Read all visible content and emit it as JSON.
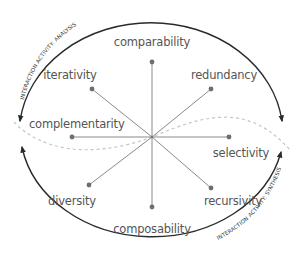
{
  "diagram": {
    "type": "radial-spoke diagram with cyclic arcs",
    "center": {
      "x": 152,
      "y": 137
    },
    "colors": {
      "spoke": "#8a8a8a",
      "dot": "#6e6e6e",
      "arc": "#2a2a2a",
      "dashed_curve": "#c4c4c4",
      "label": "#555555"
    },
    "spokes": [
      {
        "label": "comparability",
        "x": 152,
        "y": 62,
        "label_x": 152,
        "label_y": 46,
        "anchor": "middle"
      },
      {
        "label": "redundancy",
        "x": 211,
        "y": 89,
        "label_x": 224,
        "label_y": 79,
        "anchor": "middle"
      },
      {
        "label": "selectivity",
        "x": 229,
        "y": 137,
        "label_x": 241,
        "label_y": 157,
        "anchor": "middle"
      },
      {
        "label": "recursivity",
        "x": 211,
        "y": 188,
        "label_x": 233,
        "label_y": 205,
        "anchor": "middle"
      },
      {
        "label": "composability",
        "x": 152,
        "y": 207,
        "label_x": 152,
        "label_y": 233,
        "anchor": "middle"
      },
      {
        "label": "diversity",
        "x": 89,
        "y": 185,
        "label_x": 72,
        "label_y": 205,
        "anchor": "middle"
      },
      {
        "label": "complementarity",
        "x": 72,
        "y": 137,
        "label_x": 29,
        "label_y": 128,
        "anchor": "start"
      },
      {
        "label": "iteratively_placeholder_removed",
        "x": 92,
        "y": 89,
        "label_x": 70,
        "label_y": 79,
        "anchor": "middle"
      }
    ],
    "arcs": {
      "top": {
        "label": "INTERACTION ACTIVITY: ANALYSIS"
      },
      "bottom": {
        "label": "INTERACTION ACTIVITY: SYNTHESIS"
      }
    }
  },
  "labels": {
    "comparability": "comparability",
    "redundancy": "redundancy",
    "selectivity": "selectivity",
    "recursivity": "recursivity",
    "composability": "composability",
    "diversity": "diversity",
    "complementarity": "complementarity",
    "iterativity": "iterativity",
    "arc_top": "INTERACTION ACTIVITY: ANALYSIS",
    "arc_bottom": "INTERACTION ACTIVITY: SYNTHESIS"
  }
}
